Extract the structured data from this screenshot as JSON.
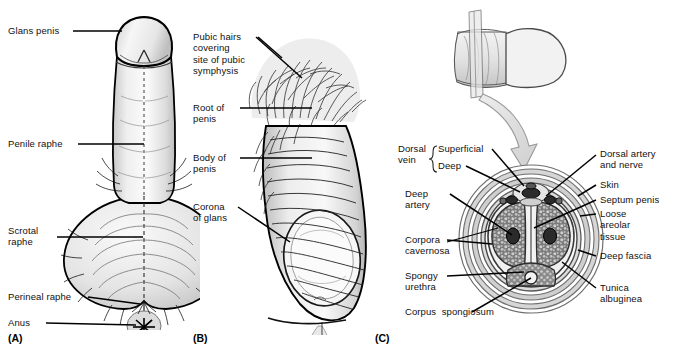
{
  "figure": {
    "background_color": "#ffffff",
    "ink_color": "#000000",
    "panels": [
      {
        "tag": "(A)",
        "name": "inferior-view-penis-scrotum",
        "labels": [
          {
            "id": "glans-penis",
            "text": "Glans penis"
          },
          {
            "id": "penile-raphe",
            "text": "Penile raphe"
          },
          {
            "id": "scrotal-raphe",
            "text": "Scrotal\nraphe"
          },
          {
            "id": "perineal-raphe",
            "text": "Perineal raphe"
          },
          {
            "id": "anus",
            "text": "Anus"
          }
        ]
      },
      {
        "tag": "(B)",
        "name": "lateral-view-penis",
        "labels": [
          {
            "id": "pubic-hairs",
            "text": "Pubic hairs\ncovering\nsite of pubic\nsymphysis"
          },
          {
            "id": "root-of-penis",
            "text": "Root of\npenis"
          },
          {
            "id": "body-of-penis",
            "text": "Body of\npenis"
          },
          {
            "id": "corona-of-glans",
            "text": "Corona\nof glans"
          }
        ]
      },
      {
        "tag": "(C)",
        "name": "transverse-section-penis",
        "labels_left": [
          {
            "id": "dorsal-vein",
            "text": "Dorsal\nvein"
          },
          {
            "id": "dorsal-vein-superficial",
            "text": "Superficial"
          },
          {
            "id": "dorsal-vein-deep",
            "text": "Deep"
          },
          {
            "id": "deep-artery",
            "text": "Deep\nartery"
          },
          {
            "id": "corpora-cavernosa",
            "text": "Corpora\ncavernosa"
          },
          {
            "id": "spongy-urethra",
            "text": "Spongy\nurethra"
          },
          {
            "id": "corpus-spongiosum",
            "text": "Corpus  spongiosum"
          }
        ],
        "labels_right": [
          {
            "id": "dorsal-artery-and-nerve",
            "text": "Dorsal artery\nand nerve"
          },
          {
            "id": "skin",
            "text": "Skin"
          },
          {
            "id": "septum-penis",
            "text": "Septum penis"
          },
          {
            "id": "loose-areolar-tissue",
            "text": "Loose\nareolar\ntissue"
          },
          {
            "id": "deep-fascia",
            "text": "Deep fascia"
          },
          {
            "id": "tunica-albuginea",
            "text": "Tunica\nalbuginea"
          }
        ]
      }
    ]
  }
}
